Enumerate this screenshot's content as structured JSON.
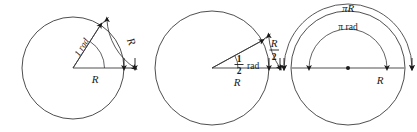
{
  "figure": {
    "background_color": "#ffffff",
    "stroke_color": "#3a3a3a",
    "radius_line_color": "#8a8a8a",
    "text_color": "#1a1a1a",
    "width": 417,
    "height": 132
  },
  "panels": [
    {
      "id": "one-radian",
      "center_x": 73,
      "center_y": 68,
      "radius": 51,
      "angle_deg": 57.3,
      "angle_label": "1 rad",
      "radius_label": "R",
      "arc_label": "R",
      "arc_offset": 11
    },
    {
      "id": "half-radian",
      "center_x": 212,
      "center_y": 68,
      "radius": 57,
      "angle_deg": 28.6,
      "angle_label_numerator": "1",
      "angle_label_denominator": "2",
      "angle_label_unit": "rad",
      "radius_label": "R",
      "arc_label_numerator": "R",
      "arc_label_denominator": "2",
      "arc_offset": 11
    },
    {
      "id": "pi-radians",
      "center_x": 348,
      "center_y": 68,
      "radius": 57,
      "angle_deg": 180,
      "angle_label": "π rad",
      "radius_label": "R",
      "arc_label": "πR",
      "inner_arc_radius": 39,
      "outer_arc_radius": 64,
      "has_center_dot": true
    }
  ],
  "labels": {
    "panel1_angle": "1 rad",
    "panel1_radius": "R",
    "panel1_arc": "R",
    "panel2_unit": "rad",
    "panel2_num": "1",
    "panel2_den": "2",
    "panel2_radius": "R",
    "panel2_arc_num": "R",
    "panel2_arc_den": "2",
    "panel3_angle": "π rad",
    "panel3_radius": "R",
    "panel3_arc": "πR"
  }
}
